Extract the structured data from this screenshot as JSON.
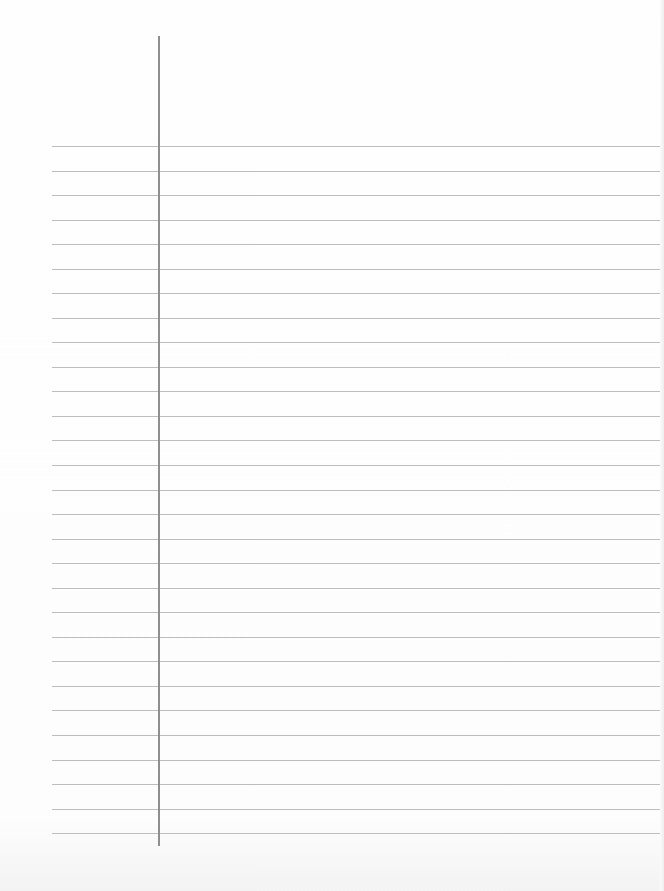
{
  "paper": {
    "type": "lined-notebook-page",
    "background_color": "#fdfdfd",
    "rule_color": "#bdbdbd",
    "margin_color": "#8f8f8f",
    "rule_count": 29,
    "rule_start_y": 146,
    "rule_spacing": 24.54,
    "rule_left_x": 52,
    "rule_right_x": 660,
    "margin_x": 158,
    "margin_top_y": 36,
    "margin_bottom_y": 846
  }
}
